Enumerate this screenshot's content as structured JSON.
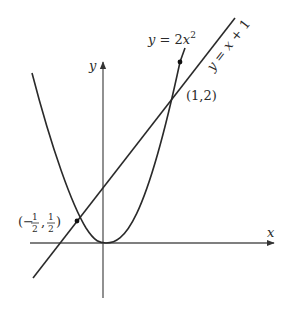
{
  "diagram": {
    "x_axis_label": "x",
    "y_axis_label": "y",
    "curves": {
      "parabola": {
        "label_prefix": "y = 2x",
        "label_exp": "2",
        "equation": "y = 2x^2"
      },
      "line": {
        "label": "y = x + 1",
        "equation": "y = x + 1"
      }
    },
    "points": [
      {
        "label": "(1,2)",
        "x": 1,
        "y": 2
      },
      {
        "label_open": "(−",
        "num1": "1",
        "den1": "2",
        "num2": "1",
        "den2": "2",
        "label_close": ")",
        "x": -0.5,
        "y": 0.5
      }
    ],
    "colors": {
      "stroke": "#2a2a2a",
      "axis": "#555555",
      "background": "#ffffff"
    }
  }
}
